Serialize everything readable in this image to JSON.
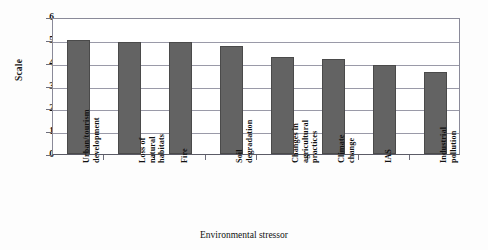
{
  "chart_data": {
    "type": "bar",
    "title": "",
    "xlabel": "Environmental stressor",
    "ylabel": "Scale",
    "ylim": [
      0,
      6
    ],
    "yticks": [
      0,
      1,
      2,
      3,
      4,
      5,
      6
    ],
    "ytick_labels": [
      "0",
      "1",
      "2",
      "3",
      "4",
      "5",
      "6"
    ],
    "grid": true,
    "legend": null,
    "bar_color": "#636363",
    "bar_edge_color": "#4a4a4a",
    "categories": [
      "Urban/tourism\ndevelopment",
      "Loss of\nnatural\nhabitats",
      "Fire",
      "Soil\ndegradation",
      "Changes in\nagricultural\npractices",
      "Climate\nchange",
      "IAS",
      "Industrial\npollution"
    ],
    "values": [
      5.0,
      4.9,
      4.9,
      4.75,
      4.25,
      4.15,
      3.9,
      3.6
    ]
  }
}
